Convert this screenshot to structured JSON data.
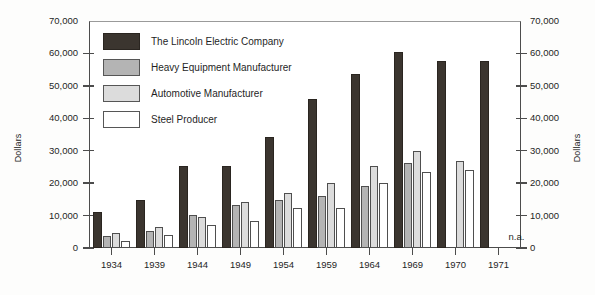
{
  "chart_data": {
    "type": "bar",
    "title": "",
    "subtitle": "",
    "xlabel": "",
    "ylabel": "Dollars",
    "ylabel_right": "Dollars",
    "ylim": [
      0,
      70000
    ],
    "ytick_step": 10000,
    "ytick_labels": [
      "70,000",
      "60,000",
      "50,000",
      "40,000",
      "30,000",
      "20,000",
      "10,000",
      "0"
    ],
    "ytick_values": [
      70000,
      60000,
      50000,
      40000,
      30000,
      20000,
      10000,
      0
    ],
    "grid": false,
    "legend_position": "upper-left-inside",
    "categories": [
      "1934",
      "1939",
      "1944",
      "1949",
      "1954",
      "1959",
      "1964",
      "1969",
      "1970",
      "1971"
    ],
    "series": [
      {
        "name": "The Lincoln Electric Company",
        "color": "#3b352f",
        "values": [
          11000,
          14700,
          25200,
          25200,
          34200,
          46000,
          53800,
          60500,
          57800,
          57800
        ]
      },
      {
        "name": "Heavy Equipment Manufacturer",
        "color": "#b4b4b4",
        "values": [
          3800,
          5400,
          10300,
          13400,
          14700,
          16000,
          19100,
          26300,
          null,
          null
        ]
      },
      {
        "name": "Automotive Manufacturer",
        "color": "#dcdcdc",
        "values": [
          4700,
          6600,
          9600,
          14200,
          17000,
          20000,
          25400,
          29800,
          26800,
          null
        ]
      },
      {
        "name": "Steel Producer",
        "color": "#ffffff",
        "values": [
          2200,
          3900,
          7200,
          8400,
          12200,
          12300,
          20000,
          23500,
          24000,
          null
        ]
      }
    ],
    "annotations": [
      {
        "text": "n.a.",
        "category": "1971",
        "note": "data not available"
      }
    ]
  },
  "legend": {
    "items": [
      {
        "label": "The Lincoln Electric Company",
        "swatch": "dark-swatch"
      },
      {
        "label": "Heavy Equipment Manufacturer",
        "swatch": "medium-gray-swatch"
      },
      {
        "label": "Automotive Manufacturer",
        "swatch": "light-gray-swatch"
      },
      {
        "label": "Steel Producer",
        "swatch": "white-swatch"
      }
    ]
  }
}
